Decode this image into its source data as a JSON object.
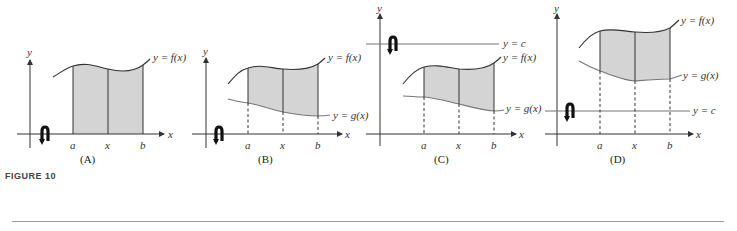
{
  "figure": {
    "label": "FIGURE 10",
    "panels": [
      {
        "id": "A",
        "caption": "(A)",
        "axis_labels": {
          "x": "x",
          "y": "y"
        },
        "ticks": [
          "a",
          "x",
          "b"
        ],
        "curves": {
          "f": "y = f(x)"
        }
      },
      {
        "id": "B",
        "caption": "(B)",
        "axis_labels": {
          "x": "x",
          "y": "y"
        },
        "ticks": [
          "a",
          "x",
          "b"
        ],
        "curves": {
          "f": "y = f(x)",
          "g": "y = g(x)"
        }
      },
      {
        "id": "C",
        "caption": "(C)",
        "axis_labels": {
          "x": "x",
          "y": "y"
        },
        "ticks": [
          "a",
          "x",
          "b"
        ],
        "curves": {
          "c": "y = c",
          "f": "y = f(x)",
          "g": "y = g(x)"
        }
      },
      {
        "id": "D",
        "caption": "(D)",
        "axis_labels": {
          "x": "x",
          "y": "y"
        },
        "ticks": [
          "a",
          "x",
          "b"
        ],
        "curves": {
          "f": "y = f(x)",
          "g": "y = g(x)",
          "c": "y = c"
        }
      }
    ],
    "colors": {
      "shade": "#d4d4d4",
      "stroke": "#333333",
      "gline": "#777777",
      "rule": "#9a9a9a"
    }
  }
}
